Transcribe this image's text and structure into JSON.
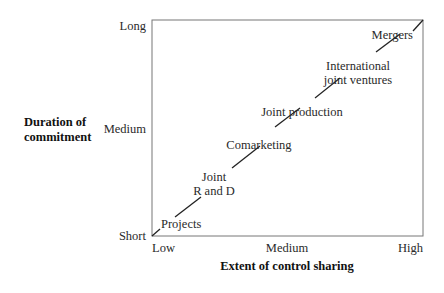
{
  "diagram": {
    "y_axis": {
      "title": [
        "Duration of",
        "commitment"
      ],
      "ticks": [
        "Long",
        "Medium",
        "Short"
      ]
    },
    "x_axis": {
      "title": "Extent of control sharing",
      "ticks": [
        "Low",
        "Medium",
        "High"
      ]
    },
    "continuum": [
      {
        "label": [
          "Projects"
        ]
      },
      {
        "label": [
          "Joint",
          "R and D"
        ]
      },
      {
        "label": [
          "Comarketing"
        ]
      },
      {
        "label": [
          "Joint production"
        ]
      },
      {
        "label": [
          "International",
          "joint ventures"
        ]
      },
      {
        "label": [
          "Mergers"
        ]
      }
    ]
  }
}
